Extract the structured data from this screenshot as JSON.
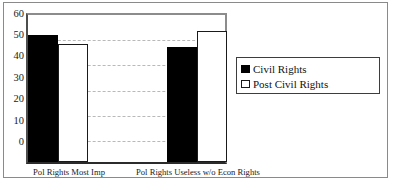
{
  "chart_data": {
    "type": "bar",
    "title": "",
    "subtitle": "",
    "xlabel": "",
    "ylabel": "",
    "categories": [
      "Pol Rights Most Imp",
      "Pol Rights Useless w/o Econ Rights"
    ],
    "series": [
      {
        "name": "Civil Rights",
        "values": [
          52,
          47
        ],
        "color": "#000000"
      },
      {
        "name": "Post Civil Rights",
        "values": [
          48,
          53.5
        ],
        "color": "#ffffff"
      }
    ],
    "ylim": [
      0,
      60
    ],
    "ytick_labels": [
      "60",
      "50",
      "40",
      "30",
      "20",
      "10",
      "0"
    ],
    "ytick_values": [
      60,
      50,
      40,
      30,
      20,
      10,
      0
    ],
    "grid": true,
    "grid_axis": "y",
    "legend_position": "right",
    "legend_entries": [
      "Civil Rights",
      "Post Civil Rights"
    ]
  },
  "legend": {
    "items": [
      {
        "label": "Civil Rights",
        "swatch": "filled-black-square-icon"
      },
      {
        "label": "Post Civil Rights",
        "swatch": "outlined-white-square-icon"
      }
    ]
  },
  "axes": {
    "y": {
      "ticks": [
        {
          "label": "60",
          "value": 60
        },
        {
          "label": "50",
          "value": 50
        },
        {
          "label": "40",
          "value": 40
        },
        {
          "label": "30",
          "value": 30
        },
        {
          "label": "20",
          "value": 20
        },
        {
          "label": "10",
          "value": 10
        },
        {
          "label": "0",
          "value": 0
        }
      ]
    },
    "x": {
      "ticks": [
        {
          "label": "Pol Rights Most Imp"
        },
        {
          "label": "Pol Rights Useless w/o Econ Rights"
        }
      ]
    }
  },
  "colors": {
    "series_civil_rights": "#000000",
    "series_post_civil_rights": "#ffffff",
    "axis": "#2b2b2b",
    "gridline": "#b9b9b9",
    "frame": "#8a8a8a"
  }
}
